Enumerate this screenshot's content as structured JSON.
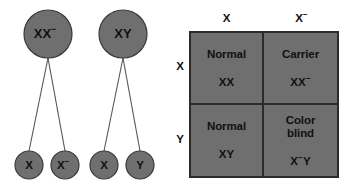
{
  "figure": {
    "kind": "punnett-square-genetics-diagram",
    "topic": "X-linked color blindness inheritance",
    "colors": {
      "cell_fill": "#6f6f6f",
      "circle_fill": "#6f6f6f",
      "outline": "#2b2b2b",
      "text": "#111111",
      "background": "#ffffff",
      "connector": "#555555"
    }
  },
  "pedigree": {
    "parents": [
      {
        "id": "mother",
        "genotype_base": "XX",
        "genotype_sup": "−",
        "cx": 48,
        "cy": 34,
        "r": 24
      },
      {
        "id": "father",
        "genotype_base": "XY",
        "genotype_sup": "",
        "cx": 123,
        "cy": 34,
        "r": 24
      }
    ],
    "gametes": [
      {
        "id": "mother-gamete-1",
        "allele_base": "X",
        "allele_sup": "",
        "cx": 29,
        "cy": 165,
        "r": 14
      },
      {
        "id": "mother-gamete-2",
        "allele_base": "X",
        "allele_sup": "−",
        "cx": 65,
        "cy": 165,
        "r": 14
      },
      {
        "id": "father-gamete-1",
        "allele_base": "X",
        "allele_sup": "",
        "cx": 104,
        "cy": 165,
        "r": 14
      },
      {
        "id": "father-gamete-2",
        "allele_base": "Y",
        "allele_sup": "",
        "cx": 140,
        "cy": 165,
        "r": 14
      }
    ],
    "connectors": [
      {
        "from": "mother",
        "to": "mother-gamete-1",
        "x1": 48,
        "y1": 58,
        "x2": 29,
        "y2": 151
      },
      {
        "from": "mother",
        "to": "mother-gamete-2",
        "x1": 48,
        "y1": 58,
        "x2": 65,
        "y2": 151
      },
      {
        "from": "father",
        "to": "father-gamete-1",
        "x1": 123,
        "y1": 58,
        "x2": 104,
        "y2": 151
      },
      {
        "from": "father",
        "to": "father-gamete-2",
        "x1": 123,
        "y1": 58,
        "x2": 140,
        "y2": 151
      }
    ]
  },
  "punnett": {
    "column_headers": [
      {
        "base": "X",
        "sup": ""
      },
      {
        "base": "X",
        "sup": "−"
      }
    ],
    "row_headers": [
      {
        "base": "X",
        "sup": ""
      },
      {
        "base": "Y",
        "sup": ""
      }
    ],
    "cells": [
      {
        "position": "top-left",
        "phenotype_line1": "Normal",
        "phenotype_line2": "",
        "genotype_pre": "XX",
        "genotype_sup": "",
        "genotype_post": ""
      },
      {
        "position": "top-right",
        "phenotype_line1": "Carrier",
        "phenotype_line2": "",
        "genotype_pre": "XX",
        "genotype_sup": "−",
        "genotype_post": ""
      },
      {
        "position": "bottom-left",
        "phenotype_line1": "Normal",
        "phenotype_line2": "",
        "genotype_pre": "XY",
        "genotype_sup": "",
        "genotype_post": ""
      },
      {
        "position": "bottom-right",
        "phenotype_line1": "Color",
        "phenotype_line2": "blind",
        "genotype_pre": "X",
        "genotype_sup": "−",
        "genotype_post": "Y"
      }
    ]
  }
}
